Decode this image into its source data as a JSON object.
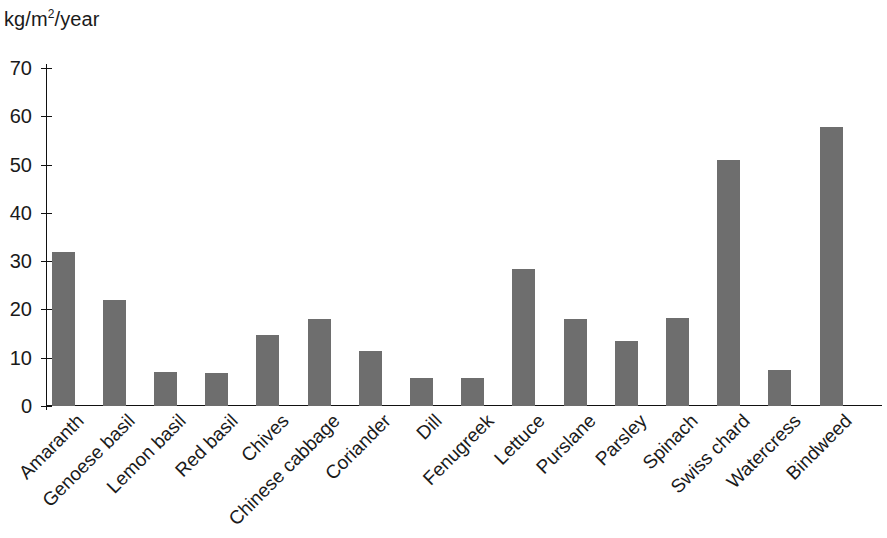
{
  "axis": {
    "unit_label_prefix": "kg/m",
    "unit_label_sup": "2",
    "unit_label_suffix": "/year"
  },
  "chart_data": {
    "type": "bar",
    "title": "",
    "subtitle": "",
    "xlabel": "",
    "ylabel": "kg/m2/year",
    "ylim": [
      0,
      70
    ],
    "yticks": [
      0,
      10,
      20,
      30,
      40,
      50,
      60,
      70
    ],
    "grid": false,
    "legend": "none",
    "bar_color": "#6e6e6e",
    "categories": [
      "Amaranth",
      "Genoese basil",
      "Lemon basil",
      "Red basil",
      "Chives",
      "Chinese cabbage",
      "Coriander",
      "Dill",
      "Fenugreek",
      "Lettuce",
      "Purslane",
      "Parsley",
      "Spinach",
      "Swiss chard",
      "Watercress",
      "Bindweed"
    ],
    "values": [
      32.0,
      22.0,
      7.1,
      6.8,
      14.7,
      18.0,
      11.3,
      5.8,
      5.8,
      28.3,
      18.0,
      13.5,
      18.2,
      51.0,
      7.5,
      57.8
    ],
    "ytick_labels": [
      "0",
      "10",
      "20",
      "30",
      "40",
      "50",
      "60",
      "70"
    ]
  }
}
